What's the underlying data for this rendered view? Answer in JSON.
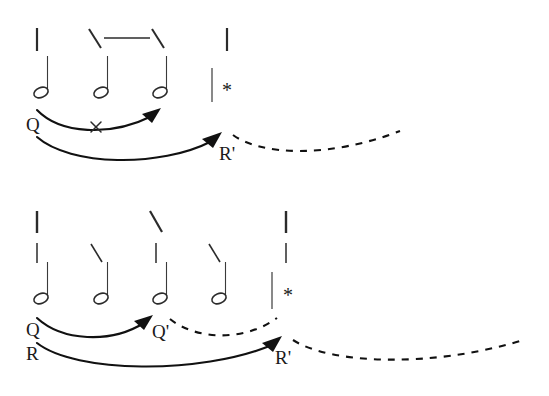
{
  "figure": {
    "background_color": "#ffffff",
    "ink_color": "#111111",
    "panels": [
      {
        "id": "panel-top",
        "grid": {
          "columns": [
            {
              "x": 38,
              "marks": [
                "vertical"
              ]
            },
            {
              "x": 98,
              "marks": [
                "backslash"
              ]
            },
            {
              "x": 157,
              "marks": [
                "backslash"
              ]
            },
            {
              "x": 212,
              "marks": [
                "vertical"
              ]
            }
          ],
          "beam": {
            "from_x": 106,
            "to_x": 150,
            "y": 38,
            "label": "horizontal-beam"
          }
        },
        "notes": [
          {
            "x": 38,
            "type": "half-note"
          },
          {
            "x": 98,
            "type": "half-note"
          },
          {
            "x": 157,
            "type": "half-note"
          }
        ],
        "barline": {
          "x": 212,
          "label": "barline"
        },
        "asterisk": {
          "x": 222,
          "y": 97,
          "text": "*"
        },
        "arrows": [
          {
            "id": "arrow-q-top",
            "label": "Q",
            "label_x": 26,
            "label_y": 131,
            "target_label": "",
            "has_cross": true,
            "cross_x": 97,
            "cross_y": 127,
            "dashed_continuation": false
          },
          {
            "id": "arrow-r-top",
            "label": "R",
            "label_x": 26,
            "label_y": 155,
            "target_label": "R'",
            "target_label_x": 219,
            "target_label_y": 160,
            "has_cross": false,
            "dashed_continuation": true
          }
        ]
      },
      {
        "id": "panel-bottom",
        "grid": {
          "columns": [
            {
              "x": 38,
              "marks": [
                "vertical",
                "vertical"
              ]
            },
            {
              "x": 98,
              "marks": [
                "backslash"
              ]
            },
            {
              "x": 157,
              "marks": [
                "backslash",
                "vertical"
              ]
            },
            {
              "x": 216,
              "marks": [
                "backslash"
              ]
            },
            {
              "x": 272,
              "marks": [
                "vertical",
                "vertical"
              ]
            }
          ],
          "beam": null
        },
        "notes": [
          {
            "x": 38,
            "type": "half-note"
          },
          {
            "x": 98,
            "type": "half-note"
          },
          {
            "x": 157,
            "type": "half-note"
          },
          {
            "x": 216,
            "type": "half-note"
          }
        ],
        "barline": {
          "x": 272,
          "label": "barline"
        },
        "asterisk": {
          "x": 283,
          "y": 302,
          "text": "*"
        },
        "arrows": [
          {
            "id": "arrow-q-bottom",
            "label": "Q",
            "label_x": 26,
            "label_y": 336,
            "target_label": "Q'",
            "target_label_x": 152,
            "target_label_y": 338,
            "has_cross": false,
            "dashed_continuation": true
          },
          {
            "id": "arrow-r-bottom",
            "label": "R",
            "label_x": 26,
            "label_y": 360,
            "target_label": "R'",
            "target_label_x": 275,
            "target_label_y": 364,
            "has_cross": false,
            "dashed_continuation": true
          }
        ]
      }
    ],
    "glyphs": {
      "asterisk": "*",
      "q_label": "Q",
      "q_prime_label": "Q'",
      "r_label": "R",
      "r_prime_label": "R'"
    }
  }
}
